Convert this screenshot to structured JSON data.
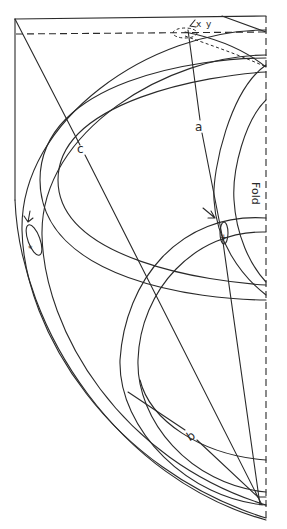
{
  "diagram": {
    "type": "pattern-drafting-diagram",
    "labels": {
      "line_a": "a",
      "line_b": "b",
      "line_c": "c",
      "fold": "Fold",
      "mark_x": "x",
      "mark_y": "y"
    },
    "colors": {
      "ink": "#2a2a2a",
      "paper": "#ffffff"
    }
  }
}
